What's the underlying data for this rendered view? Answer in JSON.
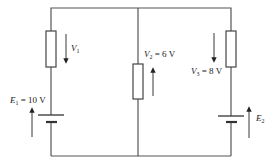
{
  "diagram": {
    "type": "circuit",
    "wire_color": "#555555",
    "labels": {
      "v1": {
        "sym": "V",
        "sub": "1",
        "val": ""
      },
      "e1": {
        "sym": "E",
        "sub": "1",
        "val": " = 10 V"
      },
      "v2": {
        "sym": "V",
        "sub": "2",
        "val": " = 6 V"
      },
      "v3": {
        "sym": "V",
        "sub": "3",
        "val": " = 8 V"
      },
      "e2": {
        "sym": "E",
        "sub": "2",
        "val": ""
      }
    },
    "components": [
      {
        "id": "R1",
        "type": "resistor",
        "branch": "left"
      },
      {
        "id": "E1",
        "type": "battery",
        "branch": "left",
        "voltage": "10 V"
      },
      {
        "id": "R2",
        "type": "resistor",
        "branch": "middle",
        "voltage": "6 V"
      },
      {
        "id": "R3",
        "type": "resistor",
        "branch": "right",
        "voltage": "8 V"
      },
      {
        "id": "E2",
        "type": "battery",
        "branch": "right"
      }
    ]
  }
}
